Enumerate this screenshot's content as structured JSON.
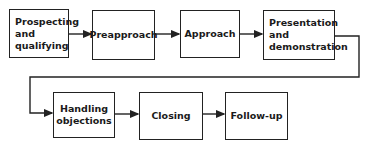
{
  "diagram": {
    "type": "flowchart",
    "steps": [
      {
        "id": "s1",
        "label": "Prospecting\nand\nqualifying"
      },
      {
        "id": "s2",
        "label": "Preapproach"
      },
      {
        "id": "s3",
        "label": "Approach"
      },
      {
        "id": "s4",
        "label": "Presentation\nand\ndemonstration"
      },
      {
        "id": "s5",
        "label": "Handling\nobjections"
      },
      {
        "id": "s6",
        "label": "Closing"
      },
      {
        "id": "s7",
        "label": "Follow-up"
      }
    ],
    "edges": [
      {
        "from": "s1",
        "to": "s2"
      },
      {
        "from": "s2",
        "to": "s3"
      },
      {
        "from": "s3",
        "to": "s4"
      },
      {
        "from": "s4",
        "to": "s5"
      },
      {
        "from": "s5",
        "to": "s6"
      },
      {
        "from": "s6",
        "to": "s7"
      }
    ],
    "colors": {
      "line": "#222222",
      "background": "#ffffff"
    }
  }
}
